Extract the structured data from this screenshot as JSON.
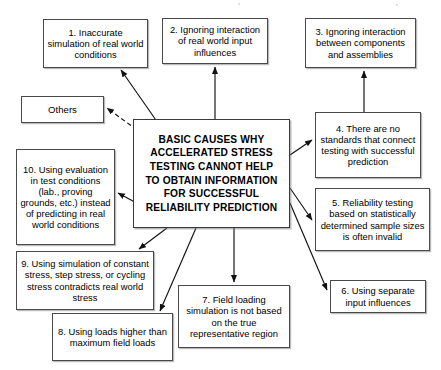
{
  "diagram": {
    "type": "cause-map",
    "title_node": {
      "id": "central",
      "text": "BASIC CAUSES WHY ACCELERATED STRESS TESTING CANNOT HELP TO OBTAIN INFORMATION FOR SUCCESSFUL RELIABILITY PREDICTION",
      "lines": [
        "BASIC CAUSES WHY",
        "ACCELERATED STRESS",
        "TESTING CANNOT HELP",
        "TO OBTAIN INFORMATION",
        "FOR SUCCESSFUL",
        "RELIABILITY PREDICTION"
      ],
      "rect": {
        "x": 133,
        "y": 119,
        "w": 157,
        "h": 109
      }
    },
    "nodes": [
      {
        "id": "cause-1",
        "number": "1",
        "text": "1. Inaccurate simulation of real world conditions",
        "rect": {
          "x": 43,
          "y": 19,
          "w": 105,
          "h": 49
        }
      },
      {
        "id": "cause-2",
        "number": "2",
        "text": "2. Ignoring interaction of real world input influences",
        "rect": {
          "x": 162,
          "y": 18,
          "w": 106,
          "h": 46
        }
      },
      {
        "id": "cause-3",
        "number": "3",
        "text": "3. Ignoring interaction between components and assemblies",
        "rect": {
          "x": 305,
          "y": 18,
          "w": 111,
          "h": 50
        }
      },
      {
        "id": "cause-4",
        "number": "4",
        "text": "4. There are no standards that connect testing with successful prediction",
        "rect": {
          "x": 315,
          "y": 112,
          "w": 106,
          "h": 66
        }
      },
      {
        "id": "cause-5",
        "number": "5",
        "text": "5. Reliability testing based on statistically determined sample sizes is often invalid",
        "rect": {
          "x": 315,
          "y": 188,
          "w": 115,
          "h": 63
        }
      },
      {
        "id": "cause-6",
        "number": "6",
        "text": "6. Using separate input influences",
        "rect": {
          "x": 330,
          "y": 280,
          "w": 96,
          "h": 33
        }
      },
      {
        "id": "cause-7",
        "number": "7",
        "text": "7. Field loading simulation is not based on the true representative region",
        "rect": {
          "x": 178,
          "y": 285,
          "w": 112,
          "h": 63
        }
      },
      {
        "id": "cause-8",
        "number": "8",
        "text": "8. Using loads higher than maximum field loads",
        "rect": {
          "x": 52,
          "y": 313,
          "w": 121,
          "h": 48
        }
      },
      {
        "id": "cause-9",
        "number": "9",
        "text": "9. Using simulation of constant stress, step stress, or cycling stress contradicts real world stress",
        "rect": {
          "x": 16,
          "y": 251,
          "w": 138,
          "h": 59
        }
      },
      {
        "id": "cause-10",
        "number": "10",
        "text": "10. Using evaluation in test conditions (lab., proving grounds, etc.) instead of predicting in real world conditions",
        "rect": {
          "x": 16,
          "y": 149,
          "w": 99,
          "h": 96
        }
      },
      {
        "id": "others",
        "number": "",
        "text": "Others",
        "rect": {
          "x": 21,
          "y": 96,
          "w": 83,
          "h": 27
        }
      }
    ],
    "edges": [
      {
        "from": "central",
        "to": "cause-1",
        "style": "solid",
        "x1": 158,
        "y1": 123,
        "x2": 121,
        "y2": 70
      },
      {
        "from": "central",
        "to": "cause-2",
        "style": "solid",
        "x1": 215,
        "y1": 119,
        "x2": 215,
        "y2": 67
      },
      {
        "from": "cause-4",
        "to": "cause-3",
        "style": "solid",
        "x1": 364,
        "y1": 112,
        "x2": 364,
        "y2": 71
      },
      {
        "from": "central",
        "to": "cause-4",
        "style": "solid",
        "x1": 290,
        "y1": 155,
        "x2": 312,
        "y2": 140
      },
      {
        "from": "central",
        "to": "cause-5",
        "style": "solid",
        "x1": 290,
        "y1": 188,
        "x2": 312,
        "y2": 220
      },
      {
        "from": "central",
        "to": "cause-6",
        "style": "solid",
        "x1": 290,
        "y1": 203,
        "x2": 327,
        "y2": 290
      },
      {
        "from": "central",
        "to": "cause-7",
        "style": "solid",
        "x1": 234,
        "y1": 228,
        "x2": 234,
        "y2": 282
      },
      {
        "from": "central",
        "to": "cause-8",
        "style": "solid",
        "x1": 196,
        "y1": 228,
        "x2": 160,
        "y2": 311
      },
      {
        "from": "central",
        "to": "cause-9",
        "style": "solid",
        "x1": 167,
        "y1": 228,
        "x2": 139,
        "y2": 249
      },
      {
        "from": "central",
        "to": "cause-10",
        "style": "solid",
        "x1": 155,
        "y1": 213,
        "x2": 118,
        "y2": 193
      },
      {
        "from": "central",
        "to": "others",
        "style": "dashed",
        "x1": 137,
        "y1": 130,
        "x2": 107,
        "y2": 108
      }
    ],
    "style": {
      "box_border": "#4a4a4a",
      "box_fill": "#ffffff",
      "text_color": "#000000",
      "edge_color": "#111111",
      "background": "#ffffff"
    }
  }
}
